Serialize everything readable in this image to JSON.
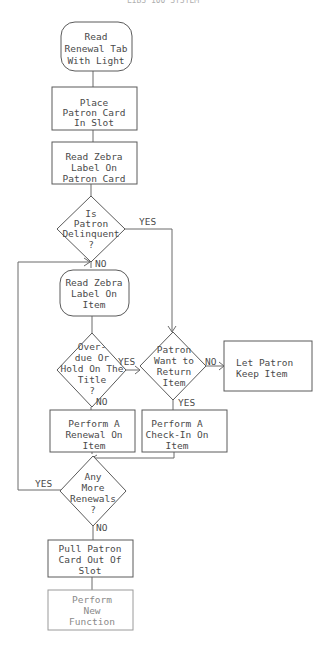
{
  "title": "LIBS 100 SYSTEM",
  "nodes": [
    {
      "id": "start",
      "type": "terminal",
      "lines": [
        "Read",
        "Renewal Tab",
        "With Light"
      ]
    },
    {
      "id": "place-card",
      "type": "process",
      "lines": [
        "Place",
        "Patron Card",
        "In Slot"
      ]
    },
    {
      "id": "read-card-label",
      "type": "process",
      "lines": [
        "Read Zebra",
        "Label On",
        "Patron Card"
      ]
    },
    {
      "id": "delinquent",
      "type": "decision",
      "lines": [
        "Is",
        "Patron",
        "Delinquent",
        "?"
      ]
    },
    {
      "id": "read-item-label",
      "type": "terminal",
      "lines": [
        "Read Zebra",
        "Label On",
        "Item"
      ]
    },
    {
      "id": "overdue-hold",
      "type": "decision",
      "lines": [
        "Over-",
        "due Or",
        "Hold On The",
        "Title",
        "?"
      ]
    },
    {
      "id": "want-return",
      "type": "decision",
      "lines": [
        "Patron",
        "Want to",
        "Return",
        "Item"
      ]
    },
    {
      "id": "keep-item",
      "type": "process",
      "lines": [
        "Let Patron",
        "Keep Item"
      ]
    },
    {
      "id": "renewal",
      "type": "process",
      "lines": [
        "Perform A",
        "Renewal On",
        "Item"
      ]
    },
    {
      "id": "checkin",
      "type": "process",
      "lines": [
        "Perform A",
        "Check-In On",
        "Item"
      ]
    },
    {
      "id": "more-renewals",
      "type": "decision",
      "lines": [
        "Any",
        "More",
        "Renewals",
        "?"
      ]
    },
    {
      "id": "pull-card",
      "type": "process",
      "lines": [
        "Pull Patron",
        "Card Out Of",
        "Slot"
      ]
    },
    {
      "id": "new-function",
      "type": "process",
      "lines": [
        "Perform",
        "New",
        "Function"
      ]
    }
  ],
  "edges": {
    "delinquent_yes": "YES",
    "delinquent_no": "NO",
    "overdue_yes": "YES",
    "overdue_no": "NO",
    "return_no": "NO",
    "return_yes": "YES",
    "more_yes": "YES",
    "more_no": "NO"
  },
  "colors": {
    "stroke": "#5a5a5a",
    "text": "#4a4a4a",
    "background": "#ffffff"
  }
}
